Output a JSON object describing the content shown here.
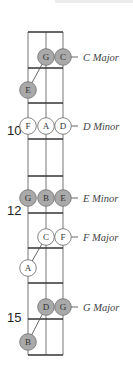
{
  "diagram": {
    "colors": {
      "string": "#777777",
      "fret": "#333333",
      "filled": "#a9a9a9",
      "empty": "#ffffff",
      "outline": "#777777",
      "label": "#444444"
    },
    "strings_x": [
      28,
      46,
      63
    ],
    "frets_y": [
      32,
      68,
      103,
      139,
      176,
      213,
      248,
      283,
      319,
      355
    ],
    "fret_numbers": [
      {
        "label": "10",
        "x": 7,
        "y": 135
      },
      {
        "label": "12",
        "x": 7,
        "y": 215
      },
      {
        "label": "15",
        "x": 7,
        "y": 322
      }
    ],
    "chords": [
      {
        "name": "C Major",
        "label_y": 57,
        "filled": true,
        "notes": [
          {
            "letter": "G",
            "x": 46,
            "y": 57
          },
          {
            "letter": "C",
            "x": 63,
            "y": 57
          },
          {
            "letter": "E",
            "x": 28,
            "y": 90
          }
        ],
        "connector": [
          [
            46,
            57
          ],
          [
            28,
            90
          ]
        ]
      },
      {
        "name": "D Minor",
        "label_y": 126,
        "filled": false,
        "notes": [
          {
            "letter": "F",
            "x": 28,
            "y": 126
          },
          {
            "letter": "A",
            "x": 46,
            "y": 126
          },
          {
            "letter": "D",
            "x": 63,
            "y": 126
          }
        ],
        "connector": null
      },
      {
        "name": "E Minor",
        "label_y": 198,
        "filled": true,
        "notes": [
          {
            "letter": "G",
            "x": 28,
            "y": 198
          },
          {
            "letter": "B",
            "x": 46,
            "y": 198
          },
          {
            "letter": "E",
            "x": 63,
            "y": 198
          }
        ],
        "connector": null
      },
      {
        "name": "F Major",
        "label_y": 237,
        "filled": false,
        "notes": [
          {
            "letter": "C",
            "x": 46,
            "y": 237
          },
          {
            "letter": "F",
            "x": 63,
            "y": 237
          },
          {
            "letter": "A",
            "x": 28,
            "y": 268
          }
        ],
        "connector": [
          [
            46,
            237
          ],
          [
            28,
            268
          ]
        ]
      },
      {
        "name": "G Major",
        "label_y": 307,
        "filled": true,
        "notes": [
          {
            "letter": "D",
            "x": 46,
            "y": 307
          },
          {
            "letter": "G",
            "x": 63,
            "y": 307
          },
          {
            "letter": "B",
            "x": 28,
            "y": 342
          }
        ],
        "connector": [
          [
            46,
            307
          ],
          [
            28,
            342
          ]
        ]
      }
    ]
  }
}
